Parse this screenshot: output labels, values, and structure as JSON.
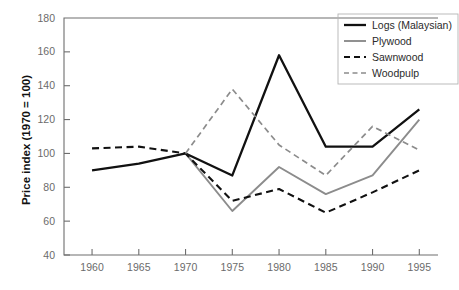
{
  "chart_data": {
    "type": "line",
    "title": "",
    "xlabel": "",
    "ylabel": "Price index (1970 = 100)",
    "x": [
      1960,
      1965,
      1970,
      1975,
      1980,
      1985,
      1990,
      1995
    ],
    "xticklabels": [
      "1960",
      "1965",
      "1970",
      "1975",
      "1980",
      "1985",
      "1990",
      "1995"
    ],
    "yticklabels": [
      "40",
      "60",
      "80",
      "100",
      "120",
      "140",
      "160",
      "180"
    ],
    "yticks": [
      40,
      60,
      80,
      100,
      120,
      140,
      160,
      180
    ],
    "xlim": [
      1957,
      1997
    ],
    "ylim": [
      40,
      180
    ],
    "grid": false,
    "legend_position": "upper right",
    "series": [
      {
        "name": "Logs (Malaysian)",
        "style": "solid",
        "color": "#111111",
        "width": 2.3,
        "x": [
          1960,
          1965,
          1970,
          1975,
          1980,
          1985,
          1990,
          1995
        ],
        "values": [
          90,
          94,
          100,
          87,
          158,
          104,
          104,
          126
        ]
      },
      {
        "name": "Plywood",
        "style": "solid",
        "color": "#8c8c8c",
        "width": 1.9,
        "x": [
          1970,
          1975,
          1980,
          1985,
          1990,
          1995
        ],
        "values": [
          100,
          66,
          92,
          76,
          87,
          120
        ]
      },
      {
        "name": "Sawnwood",
        "style": "dashed",
        "color": "#111111",
        "width": 2.1,
        "x": [
          1960,
          1965,
          1970,
          1975,
          1980,
          1985,
          1990,
          1995
        ],
        "values": [
          103,
          104,
          100,
          72,
          79,
          65,
          77,
          90
        ]
      },
      {
        "name": "Woodpulp",
        "style": "dashed",
        "color": "#8c8c8c",
        "width": 1.7,
        "x": [
          1970,
          1975,
          1980,
          1985,
          1990,
          1995
        ],
        "values": [
          100,
          138,
          105,
          87,
          116,
          102
        ]
      }
    ]
  },
  "legend": {
    "entries": [
      {
        "label": "Logs (Malaysian)"
      },
      {
        "label": "Plywood"
      },
      {
        "label": "Sawnwood"
      },
      {
        "label": "Woodpulp"
      }
    ]
  },
  "axes": {
    "y_title": "Price index (1970 = 100)"
  }
}
